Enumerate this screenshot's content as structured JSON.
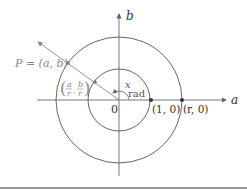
{
  "diagram": {
    "axes": {
      "x_label": "a",
      "y_label": "b",
      "origin_label": "0"
    },
    "points": {
      "p_label": "P = (a, b)",
      "unit_point_label": "(a/r, b/r)",
      "unit_point_num_a": "a",
      "unit_point_den": "r",
      "unit_point_num_b": "b",
      "one_zero_label": "(1, 0)",
      "r_zero_label": "(r, 0)"
    },
    "angle": {
      "var": "x",
      "unit": "rad"
    },
    "circles": [
      {
        "name": "unit-circle",
        "radius_label": "1"
      },
      {
        "name": "radius-r-circle",
        "radius_label": "r"
      }
    ],
    "colors": {
      "line": "#555555",
      "ray": "#888888",
      "text": "#333333",
      "gray_text": "#888888",
      "rule": "#999999"
    }
  }
}
